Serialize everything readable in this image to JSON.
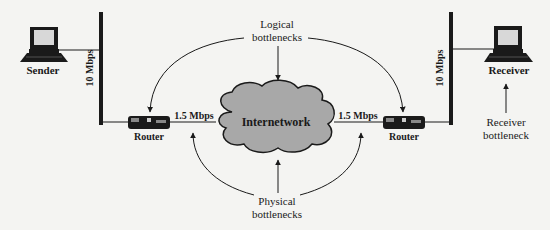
{
  "diagram": {
    "colors": {
      "background": "#f4f4f2",
      "ink": "#1a1a1a",
      "cloud_fill": "#a8a8a8",
      "screen_fill": "#d8d8d8"
    },
    "nodes": {
      "sender": {
        "label": "Sender",
        "icon": "laptop-icon"
      },
      "receiver": {
        "label": "Receiver",
        "icon": "laptop-icon"
      },
      "router_left": {
        "label": "Router",
        "icon": "router-icon"
      },
      "router_right": {
        "label": "Router",
        "icon": "router-icon"
      },
      "internetwork": {
        "label": "Internetwork",
        "icon": "cloud-icon"
      }
    },
    "links": {
      "left_lan_speed": "10 Mbps",
      "right_lan_speed": "10 Mbps",
      "left_wan_speed": "1.5 Mbps",
      "right_wan_speed": "1.5 Mbps"
    },
    "annotations": {
      "logical": {
        "line1": "Logical",
        "line2": "bottlenecks"
      },
      "physical": {
        "line1": "Physical",
        "line2": "bottlenecks"
      },
      "receiver": {
        "line1": "Receiver",
        "line2": "bottleneck"
      }
    }
  }
}
